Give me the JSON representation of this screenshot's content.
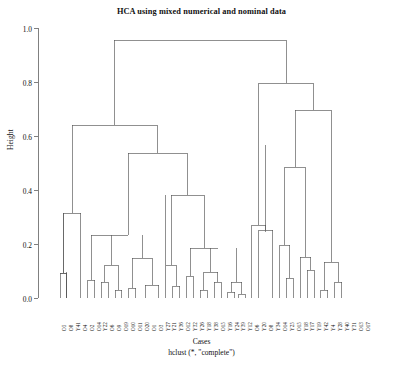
{
  "chart_data": {
    "type": "dendrogram",
    "title": "HCA using mixed numerical and nominal data",
    "xlabel": "Cases",
    "subtitle": "hclust (*, \"complete\")",
    "ylabel": "Height",
    "ylim": [
      0.0,
      1.0
    ],
    "yticks": [
      "1.0",
      "0.8",
      "0.6",
      "0.4",
      "0.2",
      "0.0"
    ],
    "ytick_values": [
      1.0,
      0.8,
      0.6,
      0.4,
      0.2,
      0.0
    ],
    "grid": false,
    "legend": "none",
    "method": "complete",
    "n_leaves": 42,
    "leaf_labels": [
      "O5",
      "O8",
      "Y41",
      "O4",
      "O2",
      "O14",
      "Y22",
      "O6",
      "O9",
      "O19",
      "O10",
      "O11",
      "O20",
      "O1",
      "O3",
      "Y27",
      "Y21",
      "Y36",
      "O12",
      "Y32",
      "Y26",
      "Y18",
      "Y38",
      "O15",
      "Y16",
      "Y24",
      "Y39",
      "Y12",
      "O6",
      "Y20",
      "O8",
      "Y34",
      "O14",
      "Y25",
      "O15",
      "Y18",
      "Y17",
      "Y19",
      "Y42",
      "Y4",
      "Y28",
      "Y40",
      "Y31",
      "O13",
      "O17"
    ],
    "merge_heights": [
      0.97,
      0.77,
      0.7,
      0.59,
      0.56,
      0.44,
      0.6,
      0.52,
      0.39,
      0.37,
      0.34,
      0.32,
      0.28,
      0.22,
      0.22,
      0.22,
      0.17,
      0.16,
      0.15,
      0.14,
      0.11,
      0.1,
      0.1,
      0.1,
      0.09,
      0.09,
      0.08,
      0.08,
      0.07,
      0.07,
      0.06,
      0.06,
      0.05,
      0.05,
      0.05,
      0.04,
      0.04,
      0.03,
      0.03,
      0.02,
      0.02,
      0.02
    ],
    "root_height": 0.97
  }
}
